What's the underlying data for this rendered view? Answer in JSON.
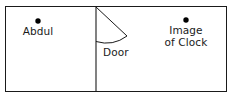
{
  "diagram": {
    "type": "floor-plan",
    "background_color": "#ffffff",
    "stroke_color": "#1a1a1a",
    "marker_color": "#000000",
    "outer_room": {
      "name": "room-outline",
      "x": 5,
      "y": 6,
      "width": 222,
      "height": 86
    },
    "partition_wall": {
      "name": "dividing-wall",
      "x": 96,
      "y_top": 6,
      "y_bottom": 92
    },
    "door": {
      "label": "Door",
      "hinge_x": 96,
      "hinge_y": 7,
      "leaf_tip_x": 127,
      "leaf_tip_y": 36,
      "arc_end_x": 96,
      "arc_end_y": 41,
      "swing_radius": 35
    },
    "markers": [
      {
        "name": "abdul",
        "label_lines": [
          "Abdul"
        ],
        "dot_x": 38,
        "dot_y": 21,
        "dot_radius": 2.6
      },
      {
        "name": "image-of-clock",
        "label_lines": [
          "Image",
          "of Clock"
        ],
        "dot_x": 186,
        "dot_y": 20,
        "dot_radius": 2.6
      }
    ]
  },
  "labels": {
    "abdul": "Abdul",
    "door": "Door",
    "clock_line1": "Image",
    "clock_line2": "of Clock"
  }
}
